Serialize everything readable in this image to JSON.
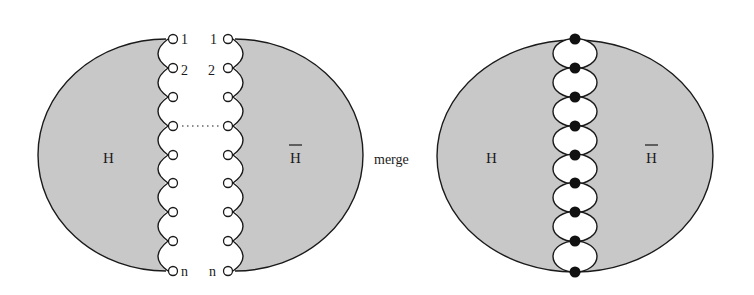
{
  "figure": {
    "type": "graph-merge-diagram",
    "colors": {
      "region_fill": "#c8c8c8",
      "stroke": "#1a1a1a",
      "open_port_fill": "#ffffff",
      "merged_node_fill": "#111111"
    }
  },
  "left_diagram": {
    "left_region_label": "H",
    "right_region_label": "H",
    "right_region_overbar": true,
    "left_chain_labels": {
      "first": "1",
      "second": "2",
      "last": "n"
    },
    "right_chain_labels": {
      "first": "1",
      "second": "2",
      "last": "n"
    },
    "port_count_drawn": 9,
    "ellipsis_row_index": 3,
    "ellipsis": "......"
  },
  "operation_label": "merge",
  "right_diagram": {
    "left_region_label": "H",
    "right_region_label": "H",
    "right_region_overbar": true,
    "merged_node_count": 9
  }
}
